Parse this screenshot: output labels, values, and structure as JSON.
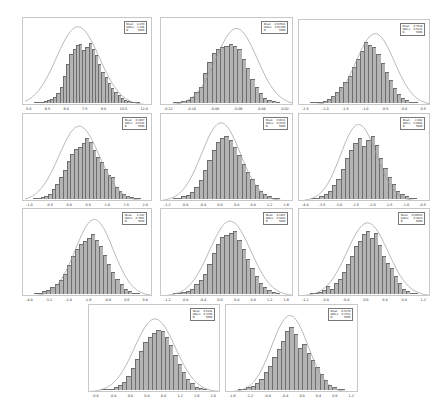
{
  "chart_data": [
    {
      "type": "histogram",
      "panel": 1,
      "legend": {
        "mean_label": "Mean",
        "mean": "8.470",
        "stdev_label": "StDev",
        "stdev": "1.186",
        "n_label": "N",
        "n": "5000"
      },
      "xticks": [
        "5.0",
        "6.5",
        "6.0",
        "7.5",
        "9.0",
        "10.5",
        "12.0"
      ],
      "bins": [
        1,
        1,
        2,
        3,
        5,
        6,
        9,
        14,
        24,
        40,
        58,
        72,
        80,
        85,
        86,
        78,
        82,
        88,
        80,
        70,
        58,
        46,
        38,
        30,
        22,
        16,
        12,
        8,
        5,
        3,
        2,
        1,
        1
      ],
      "curve": {
        "mu": 0.42,
        "sigma": 0.17,
        "peak": 0.92
      }
    },
    {
      "type": "histogram",
      "panel": 2,
      "legend": {
        "mean_label": "Mean",
        "mean": "-0.07013",
        "stdev_label": "StDev",
        "stdev": "0.01706",
        "n_label": "N",
        "n": "5000"
      },
      "xticks": [
        "-0.12",
        "-0.10",
        "-0.08",
        "-0.06",
        "-0.04",
        "-0.02"
      ],
      "bins": [
        1,
        2,
        3,
        5,
        9,
        16,
        24,
        44,
        60,
        74,
        80,
        82,
        84,
        86,
        84,
        80,
        64,
        52,
        36,
        24,
        14,
        8,
        5,
        3,
        2
      ],
      "curve": {
        "mu": 0.57,
        "sigma": 0.16,
        "peak": 0.9
      }
    },
    {
      "type": "histogram",
      "panel": 3,
      "legend": {
        "mean_label": "Mean",
        "mean": "-0.7638",
        "stdev_label": "StDev",
        "stdev": "0.5131",
        "n_label": "N",
        "n": "5000"
      },
      "xticks": [
        "-2.5",
        "-2.0",
        "-1.5",
        "-1.0",
        "-0.5",
        "0.0",
        "0.5"
      ],
      "bins": [
        1,
        1,
        2,
        3,
        6,
        10,
        16,
        24,
        32,
        40,
        54,
        66,
        78,
        92,
        88,
        84,
        74,
        60,
        46,
        34,
        22,
        14,
        8,
        4,
        2,
        1
      ],
      "curve": {
        "mu": 0.58,
        "sigma": 0.15,
        "peak": 0.86
      }
    },
    {
      "type": "histogram",
      "panel": 4,
      "legend": {
        "mean_label": "Mean",
        "mean": "0.1967",
        "stdev_label": "StDev",
        "stdev": "0.5342",
        "n_label": "N",
        "n": "5000"
      },
      "xticks": [
        "-1.0",
        "-0.5",
        "0.0",
        "0.5",
        "1.0",
        "1.5",
        "2.0"
      ],
      "bins": [
        1,
        1,
        3,
        5,
        8,
        14,
        22,
        32,
        42,
        56,
        66,
        74,
        76,
        82,
        90,
        84,
        72,
        62,
        54,
        44,
        36,
        32,
        18,
        12,
        8,
        5,
        3,
        2,
        1
      ],
      "curve": {
        "mu": 0.43,
        "sigma": 0.16,
        "peak": 0.88
      }
    },
    {
      "type": "histogram",
      "panel": 5,
      "legend": {
        "mean_label": "Mean",
        "mean": "0.0213",
        "stdev_label": "StDev",
        "stdev": "0.4116",
        "n_label": "N",
        "n": "5000"
      },
      "xticks": [
        "-1.2",
        "-0.8",
        "-0.4",
        "0.0",
        "0.4",
        "0.8",
        "1.2",
        "1.6"
      ],
      "bins": [
        1,
        2,
        4,
        6,
        10,
        18,
        28,
        42,
        58,
        72,
        84,
        90,
        92,
        86,
        76,
        64,
        52,
        40,
        30,
        20,
        12,
        7,
        4,
        2,
        1
      ],
      "curve": {
        "mu": 0.45,
        "sigma": 0.15,
        "peak": 0.92
      }
    },
    {
      "type": "histogram",
      "panel": 6,
      "legend": {
        "mean_label": "Mean",
        "mean": "-2.082",
        "stdev_label": "StDev",
        "stdev": "0.4685",
        "n_label": "N",
        "n": "5000"
      },
      "xticks": [
        "-4.0",
        "-3.5",
        "-3.0",
        "-2.5",
        "-2.0",
        "-1.5",
        "-1.0",
        "-0.5"
      ],
      "bins": [
        1,
        2,
        4,
        8,
        12,
        20,
        30,
        44,
        60,
        72,
        82,
        90,
        78,
        86,
        92,
        80,
        60,
        46,
        32,
        22,
        12,
        8,
        4,
        2,
        1
      ],
      "curve": {
        "mu": 0.45,
        "sigma": 0.14,
        "peak": 0.9
      }
    },
    {
      "type": "histogram",
      "panel": 7,
      "legend": {
        "mean_label": "Mean",
        "mean": "-1.347",
        "stdev_label": "StDev",
        "stdev": "0.7961",
        "n_label": "N",
        "n": "5000"
      },
      "xticks": [
        "-4.0",
        "-3.2",
        "-2.4",
        "-1.6",
        "-0.8",
        "0.0",
        "0.8"
      ],
      "bins": [
        1,
        2,
        4,
        6,
        10,
        14,
        20,
        30,
        42,
        56,
        66,
        74,
        78,
        82,
        88,
        80,
        70,
        58,
        44,
        32,
        22,
        14,
        8,
        4,
        2,
        1
      ],
      "curve": {
        "mu": 0.55,
        "sigma": 0.15,
        "peak": 0.9
      }
    },
    {
      "type": "histogram",
      "panel": 8,
      "legend": {
        "mean_label": "Mean",
        "mean": "0.1467",
        "stdev_label": "StDev",
        "stdev": "0.4182",
        "n_label": "N",
        "n": "5000"
      },
      "xticks": [
        "-1.2",
        "-0.8",
        "-0.4",
        "0.0",
        "0.4",
        "0.8",
        "1.2",
        "1.6"
      ],
      "bins": [
        1,
        2,
        3,
        5,
        8,
        14,
        20,
        30,
        44,
        60,
        74,
        84,
        86,
        90,
        92,
        80,
        66,
        52,
        38,
        26,
        16,
        10,
        6,
        3,
        1
      ],
      "curve": {
        "mu": 0.52,
        "sigma": 0.16,
        "peak": 0.88
      }
    },
    {
      "type": "histogram",
      "panel": 9,
      "legend": {
        "mean_label": "Mean",
        "mean": "-0.06652",
        "stdev_label": "StDev",
        "stdev": "0.3813",
        "n_label": "N",
        "n": "5000"
      },
      "xticks": [
        "-1.2",
        "-0.8",
        "-0.4",
        "0.0",
        "0.4",
        "0.8",
        "1.2"
      ],
      "bins": [
        1,
        2,
        3,
        6,
        12,
        8,
        16,
        22,
        32,
        44,
        56,
        70,
        78,
        88,
        92,
        82,
        90,
        72,
        56,
        46,
        38,
        26,
        16,
        8,
        4,
        2,
        1
      ],
      "curve": {
        "mu": 0.52,
        "sigma": 0.16,
        "peak": 0.86
      }
    },
    {
      "type": "histogram",
      "panel": 10,
      "legend": {
        "mean_label": "Mean",
        "mean": "0.5343",
        "stdev_label": "StDev",
        "stdev": "0.3356",
        "n_label": "N",
        "n": "5000"
      },
      "xticks": [
        "-0.8",
        "-0.4",
        "0.0",
        "0.4",
        "0.8",
        "1.2",
        "1.6",
        "2.0"
      ],
      "bins": [
        1,
        1,
        2,
        4,
        7,
        12,
        20,
        32,
        46,
        58,
        70,
        78,
        84,
        88,
        86,
        78,
        66,
        52,
        38,
        26,
        16,
        10,
        5,
        3,
        1
      ],
      "curve": {
        "mu": 0.5,
        "sigma": 0.16,
        "peak": 0.86
      }
    },
    {
      "type": "histogram",
      "panel": 11,
      "legend": {
        "mean_label": "Mean",
        "mean": "-0.5270",
        "stdev_label": "StDev",
        "stdev": "0.2713",
        "n_label": "N",
        "n": "5000"
      },
      "xticks": [
        "-1.6",
        "-1.2",
        "-0.8",
        "-0.4",
        "0.0",
        "0.4",
        "0.8",
        "1.2"
      ],
      "bins": [
        1,
        2,
        4,
        6,
        10,
        16,
        26,
        36,
        48,
        60,
        72,
        86,
        92,
        82,
        62,
        68,
        54,
        44,
        34,
        24,
        14,
        8,
        4,
        2,
        1
      ],
      "curve": {
        "mu": 0.48,
        "sigma": 0.14,
        "peak": 0.9
      }
    }
  ],
  "style": {
    "bar_fill": "#b4b4b4",
    "bar_edge": "#6e6e6e",
    "curve_color": "#999999",
    "frame": "#c8c8c8"
  }
}
